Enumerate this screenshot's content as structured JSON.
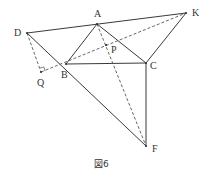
{
  "figure": {
    "caption": "図6",
    "points": {
      "A": {
        "label": "A",
        "x": 97,
        "y": 24,
        "lx": 94,
        "ly": 17
      },
      "B": {
        "label": "B",
        "x": 66,
        "y": 64,
        "lx": 61,
        "ly": 78
      },
      "C": {
        "label": "C",
        "x": 146,
        "y": 63,
        "lx": 150,
        "ly": 69
      },
      "D": {
        "label": "D",
        "x": 27,
        "y": 33,
        "lx": 14,
        "ly": 36
      },
      "K": {
        "label": "K",
        "x": 186,
        "y": 13,
        "lx": 192,
        "ly": 16
      },
      "P": {
        "label": "P",
        "x": 106,
        "y": 45,
        "lx": 111,
        "ly": 53
      },
      "Q": {
        "label": "Q",
        "x": 41,
        "y": 72,
        "lx": 37,
        "ly": 86
      },
      "F": {
        "label": "F",
        "x": 146,
        "y": 146,
        "lx": 152,
        "ly": 152
      }
    },
    "solid_segments": [
      [
        "D",
        "K"
      ],
      [
        "D",
        "F"
      ],
      [
        "A",
        "B"
      ],
      [
        "A",
        "C"
      ],
      [
        "B",
        "C"
      ],
      [
        "C",
        "F"
      ],
      [
        "C",
        "K"
      ]
    ],
    "dashed_segments": [
      [
        "D",
        "Q"
      ],
      [
        "Q",
        "K"
      ],
      [
        "A",
        "F"
      ]
    ],
    "right_angle_at": "Q"
  }
}
